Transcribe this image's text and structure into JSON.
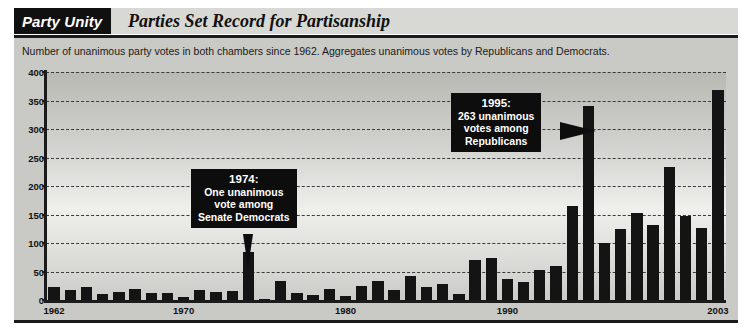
{
  "header": {
    "kicker": "Party Unity",
    "headline": "Parties Set Record for Partisanship"
  },
  "subtitle": "Number of unanimous party votes in both chambers since 1962. Aggregates unanimous votes by Republicans and Democrats.",
  "annotations": [
    {
      "id": "callout-1974",
      "title": "1974:",
      "line1": "One unanimous",
      "line2": "vote among",
      "line3": "Senate Democrats",
      "points_to_year": 1974,
      "pointer": "down"
    },
    {
      "id": "callout-1995",
      "title": "1995:",
      "line1": "263 unanimous",
      "line2": "votes among",
      "line3": "Republicans",
      "points_to_year": 1995,
      "pointer": "right"
    }
  ],
  "colors": {
    "bar": "#141414",
    "kicker_bg": "#0d0d0d",
    "kicker_text": "#ffffff",
    "panel_bg": "#c9c9c5",
    "rule": "#1a1a1a"
  },
  "chart_data": {
    "type": "bar",
    "title": "Parties Set Record for Partisanship",
    "subtitle": "Number of unanimous party votes in both chambers since 1962. Aggregates unanimous votes by Republicans and Democrats.",
    "xlabel": "",
    "ylabel": "",
    "ylim": [
      0,
      400
    ],
    "yticks": [
      0,
      50,
      100,
      150,
      200,
      250,
      300,
      350,
      400
    ],
    "xticks_labeled": [
      1962,
      1970,
      1980,
      1990,
      2003
    ],
    "grid": "horizontal-dashed",
    "legend": "none",
    "categories": [
      1962,
      1963,
      1964,
      1965,
      1966,
      1967,
      1968,
      1969,
      1970,
      1971,
      1972,
      1973,
      1974,
      1975,
      1976,
      1977,
      1978,
      1979,
      1980,
      1981,
      1982,
      1983,
      1984,
      1985,
      1986,
      1987,
      1988,
      1989,
      1990,
      1991,
      1992,
      1993,
      1994,
      1995,
      1996,
      1997,
      1998,
      1999,
      2000,
      2001,
      2002,
      2003
    ],
    "values": [
      22,
      17,
      23,
      11,
      14,
      19,
      13,
      13,
      6,
      17,
      14,
      15,
      85,
      2,
      34,
      12,
      9,
      20,
      7,
      24,
      33,
      18,
      42,
      22,
      28,
      11,
      70,
      74,
      36,
      31,
      52,
      60,
      165,
      340,
      100,
      125,
      152,
      131,
      233,
      148,
      126,
      368
    ]
  }
}
